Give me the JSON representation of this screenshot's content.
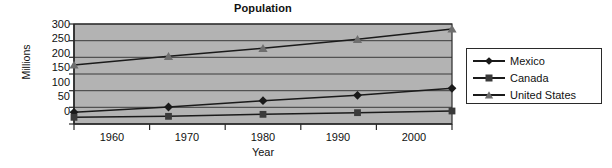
{
  "chart_data": {
    "type": "line",
    "title": "Population",
    "xlabel": "Year",
    "ylabel": "Millions",
    "categories": [
      "1960",
      "1970",
      "1980",
      "1990",
      "2000"
    ],
    "ylim": [
      0,
      300
    ],
    "yticks": [
      "300",
      "250",
      "200",
      "150",
      "100",
      "50",
      "0"
    ],
    "grid": true,
    "legend_position": "right",
    "plot_background": "#b3b3b3",
    "line_color": "#1a1a1a",
    "series": [
      {
        "name": "Mexico",
        "marker": "diamond",
        "color": "#1a1a1a",
        "values": [
          35,
          51,
          70,
          86,
          107
        ]
      },
      {
        "name": "Canada",
        "marker": "square",
        "color": "#3a3a3a",
        "values": [
          20,
          23,
          29,
          34,
          39
        ]
      },
      {
        "name": "United States",
        "marker": "triangle",
        "color": "#6e6e6e",
        "values": [
          177,
          203,
          227,
          254,
          285
        ]
      }
    ]
  }
}
